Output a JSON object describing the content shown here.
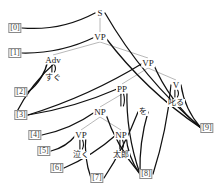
{
  "diagram": {
    "type": "parse-tree",
    "width": 224,
    "height": 190,
    "background_color": "#ffffff",
    "edge_color": "#111111",
    "tree_edge_color": "#b0b0b0",
    "index_box_color": "#8a8a8a"
  },
  "nodes": [
    {
      "id": "S",
      "label": "S",
      "x": 100,
      "y": 13,
      "kind": "nonterminal"
    },
    {
      "id": "VP1",
      "label": "VP",
      "x": 100,
      "y": 37,
      "kind": "nonterminal"
    },
    {
      "id": "Adv",
      "label": "Adv",
      "x": 53,
      "y": 60,
      "kind": "nonterminal"
    },
    {
      "id": "VP2",
      "label": "VP",
      "x": 148,
      "y": 63,
      "kind": "nonterminal"
    },
    {
      "id": "PP",
      "label": "PP",
      "x": 122,
      "y": 89,
      "kind": "nonterminal"
    },
    {
      "id": "V",
      "label": "V",
      "x": 176,
      "y": 85,
      "kind": "nonterminal"
    },
    {
      "id": "NP1",
      "label": "NP",
      "x": 100,
      "y": 112,
      "kind": "nonterminal"
    },
    {
      "id": "VP3",
      "label": "VP",
      "x": 81,
      "y": 135,
      "kind": "nonterminal"
    },
    {
      "id": "NP2",
      "label": "NP",
      "x": 121,
      "y": 135,
      "kind": "nonterminal"
    }
  ],
  "terminals": [
    {
      "id": "t_sugu",
      "label": "すぐ",
      "x": 53,
      "y": 78,
      "parent": "Adv"
    },
    {
      "id": "t_wo",
      "label": "を",
      "x": 143,
      "y": 112,
      "parent": "PP"
    },
    {
      "id": "t_shikaru",
      "label": "叱る",
      "x": 176,
      "y": 103,
      "parent": "V"
    },
    {
      "id": "t_naku",
      "label": "泣く",
      "x": 81,
      "y": 155,
      "parent": "VP3"
    },
    {
      "id": "t_taro",
      "label": "太郎",
      "x": 121,
      "y": 155,
      "parent": "NP2"
    }
  ],
  "indices": [
    {
      "id": "i0",
      "label": "[0]",
      "x": 15,
      "y": 28
    },
    {
      "id": "i1",
      "label": "[1]",
      "x": 15,
      "y": 53
    },
    {
      "id": "i2",
      "label": "[2]",
      "x": 21,
      "y": 92
    },
    {
      "id": "i3",
      "label": "[3]",
      "x": 21,
      "y": 115
    },
    {
      "id": "i4",
      "label": "[4]",
      "x": 35,
      "y": 135
    },
    {
      "id": "i5",
      "label": "[5]",
      "x": 44,
      "y": 151
    },
    {
      "id": "i6",
      "label": "[6]",
      "x": 57,
      "y": 168
    },
    {
      "id": "i7",
      "label": "[7]",
      "x": 97,
      "y": 178
    },
    {
      "id": "i8",
      "label": "[8]",
      "x": 146,
      "y": 174
    },
    {
      "id": "i9",
      "label": "[9]",
      "x": 207,
      "y": 128
    }
  ],
  "tree_edges": [
    {
      "from": "S",
      "to": "VP1"
    },
    {
      "from": "VP1",
      "to": "Adv"
    },
    {
      "from": "VP1",
      "to": "VP2"
    },
    {
      "from": "VP2",
      "to": "PP"
    },
    {
      "from": "VP2",
      "to": "V"
    },
    {
      "from": "PP",
      "to": "NP1"
    },
    {
      "from": "NP1",
      "to": "VP3"
    },
    {
      "from": "NP1",
      "to": "NP2"
    }
  ],
  "span_edges": [
    {
      "node": "S",
      "left_index": "i0",
      "right_index": "i9"
    },
    {
      "node": "VP1",
      "left_index": "i1",
      "right_index": "i9"
    },
    {
      "node": "Adv",
      "left_index": "i2",
      "right_index": "i3"
    },
    {
      "node": "VP2",
      "left_index": "i3",
      "right_index": "i9"
    },
    {
      "node": "PP",
      "left_index": "i3",
      "right_index": "i8"
    },
    {
      "node": "V",
      "left_index": "i8",
      "right_index": "i9"
    },
    {
      "node": "NP1",
      "left_index": "i4",
      "right_index": "i8"
    },
    {
      "node": "VP3",
      "left_index": "i5",
      "right_index": "i7"
    },
    {
      "node": "NP2",
      "left_index": "i6",
      "right_index": "i8"
    },
    {
      "node": "t_wo",
      "left_index": "i7",
      "right_index": "i8"
    }
  ],
  "sentence_tokens": [
    "すぐ",
    "泣く",
    "太郎",
    "を",
    "叱る"
  ]
}
